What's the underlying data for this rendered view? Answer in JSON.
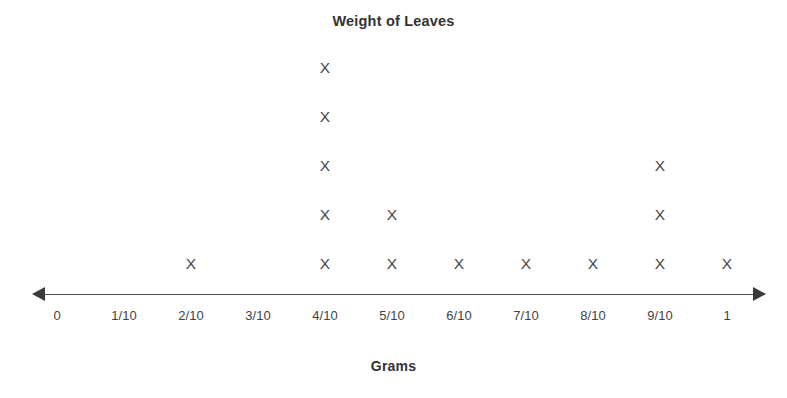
{
  "chart": {
    "title": "Weight of Leaves",
    "axis_caption": "Grams",
    "marker_glyph": "X"
  },
  "chart_data": {
    "type": "dotplot",
    "title": "Weight of Leaves",
    "xlabel": "Grams",
    "ylabel": "",
    "categories": [
      "0",
      "1/10",
      "2/10",
      "3/10",
      "4/10",
      "5/10",
      "6/10",
      "7/10",
      "8/10",
      "9/10",
      "1"
    ],
    "values": [
      0,
      0,
      1,
      0,
      5,
      2,
      1,
      1,
      1,
      3,
      1
    ],
    "marker": "X",
    "grid": false,
    "legend": "none",
    "axis_arrows": "both",
    "total_count": 15
  },
  "layout": {
    "tick_x": [
      57,
      124,
      191,
      258,
      325,
      392,
      459,
      526,
      593,
      660,
      727
    ],
    "row_y": [
      264,
      215,
      166,
      117,
      68
    ],
    "marker_color": "#464646",
    "axis_color": "#4a4a4a",
    "title_color": "#333333",
    "background": "#ffffff"
  }
}
